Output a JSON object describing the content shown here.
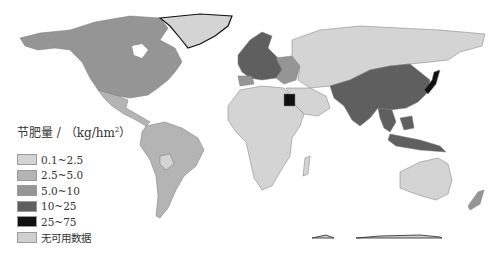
{
  "legend": {
    "title_prefix": "节肥量 / （kg/hm",
    "title_sup": "2",
    "title_suffix": "）",
    "items": [
      {
        "label": "0.1~2.5",
        "color": "#d4d4d4"
      },
      {
        "label": "2.5~5.0",
        "color": "#b4b4b4"
      },
      {
        "label": "5.0~10",
        "color": "#959595"
      },
      {
        "label": "10~25",
        "color": "#5f5f5f"
      },
      {
        "label": "25~75",
        "color": "#111111"
      },
      {
        "label": "无可用数据",
        "color": "#cfcfcf"
      }
    ]
  },
  "regions": {
    "north_america": "#959595",
    "greenland": "#d4d4d4",
    "mexico_central": "#b4b4b4",
    "south_america": "#b4b4b4",
    "europe_west": "#5f5f5f",
    "europe_east": "#959595",
    "russia_central_asia": "#d4d4d4",
    "china_india": "#5f5f5f",
    "japan": "#111111",
    "egypt": "#111111",
    "africa": "#d4d4d4",
    "middle_east": "#d4d4d4",
    "southeast_asia": "#5f5f5f",
    "australia": "#d4d4d4",
    "new_zealand": "#959595",
    "antarctica": "#cfcfcf"
  }
}
